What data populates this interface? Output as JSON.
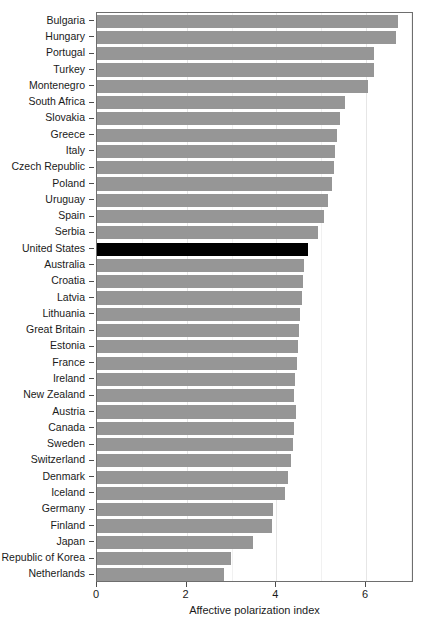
{
  "chart_data": {
    "type": "bar",
    "orientation": "horizontal",
    "title": "",
    "xlabel": "Affective polarization index",
    "ylabel": "",
    "xlim": [
      0,
      7.07
    ],
    "ylim": [
      0,
      33
    ],
    "grid": true,
    "legend": false,
    "x_ticks": [
      0,
      2,
      4,
      6
    ],
    "x_tick_labels": [
      "0",
      "2",
      "4",
      "6"
    ],
    "highlight_category": "United States",
    "colors": {
      "bar": "#969696",
      "highlight": "#000000",
      "panel_border": "#6e6e6e",
      "gridline": "#e6e6e6",
      "background": "#ffffff",
      "text": "#1a1a1a"
    },
    "categories": [
      "Bulgaria",
      "Hungary",
      "Portugal",
      "Turkey",
      "Montenegro",
      "South Africa",
      "Slovakia",
      "Greece",
      "Italy",
      "Czech Republic",
      "Poland",
      "Uruguay",
      "Spain",
      "Serbia",
      "United States",
      "Australia",
      "Croatia",
      "Latvia",
      "Lithuania",
      "Great Britain",
      "Estonia",
      "France",
      "Ireland",
      "New Zealand",
      "Austria",
      "Canada",
      "Sweden",
      "Switzerland",
      "Denmark",
      "Iceland",
      "Germany",
      "Finland",
      "Japan",
      "Republic of Korea",
      "Netherlands"
    ],
    "values": [
      6.71,
      6.67,
      6.18,
      6.17,
      6.04,
      5.53,
      5.42,
      5.35,
      5.3,
      5.28,
      5.24,
      5.15,
      5.06,
      4.93,
      4.71,
      4.62,
      4.6,
      4.57,
      4.53,
      4.5,
      4.48,
      4.45,
      4.42,
      4.4,
      4.43,
      4.39,
      4.38,
      4.32,
      4.27,
      4.19,
      3.93,
      3.9,
      3.48,
      2.99,
      2.83
    ]
  }
}
